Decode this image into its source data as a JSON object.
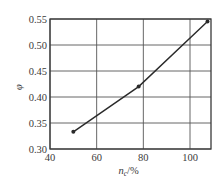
{
  "chart_data": {
    "type": "line",
    "title": "",
    "xlabel": "n_c/%",
    "xlabel_main": "n",
    "xlabel_sub": "c",
    "xlabel_unit": "/%",
    "ylabel": "φ",
    "x": [
      50,
      78,
      107.5
    ],
    "series": [
      {
        "name": "φ",
        "values": [
          0.333,
          0.42,
          0.545
        ],
        "marker": "circle"
      }
    ],
    "xlim": [
      40,
      109
    ],
    "ylim": [
      0.3,
      0.55
    ],
    "xticks": [
      40,
      60,
      80,
      100
    ],
    "xtick_labels": [
      "40",
      "60",
      "80",
      "100"
    ],
    "yticks": [
      0.3,
      0.35,
      0.4,
      0.45,
      0.5,
      0.55
    ],
    "ytick_labels": [
      "0.30",
      "0.35",
      "0.40",
      "0.45",
      "0.50",
      "0.55"
    ],
    "grid": true,
    "legend": null
  },
  "colors": {
    "axis": "#3a3a3a",
    "grid": "#555555",
    "line": "#2a2a2a",
    "background": "#ffffff"
  }
}
